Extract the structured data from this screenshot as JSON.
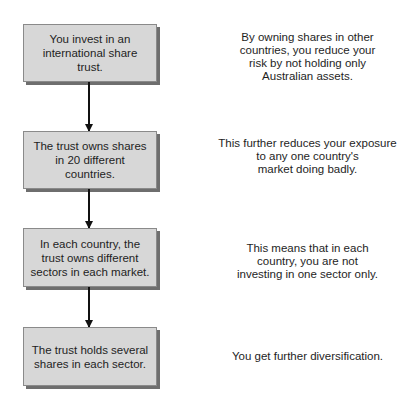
{
  "diagram": {
    "type": "flowchart",
    "steps": [
      {
        "label": "You invest in an\ninternational share trust.",
        "note": "By owning shares in other\ncountries, you reduce your\nrisk by not holding only\nAustralian assets."
      },
      {
        "label": "The trust owns shares\nin 20 different countries.",
        "note": "This further reduces your exposure\nto any one country's\nmarket doing badly."
      },
      {
        "label": "In each country, the\ntrust owns different\nsectors in each market.",
        "note": "This means that in each\ncountry, you are not\ninvesting in one sector only."
      },
      {
        "label": "The trust holds several\nshares in each sector.",
        "note": "You get further diversification."
      }
    ],
    "colors": {
      "box_fill": "#d7d7d7",
      "box_shadow": "#6e6e6e",
      "arrow": "#111111"
    }
  }
}
